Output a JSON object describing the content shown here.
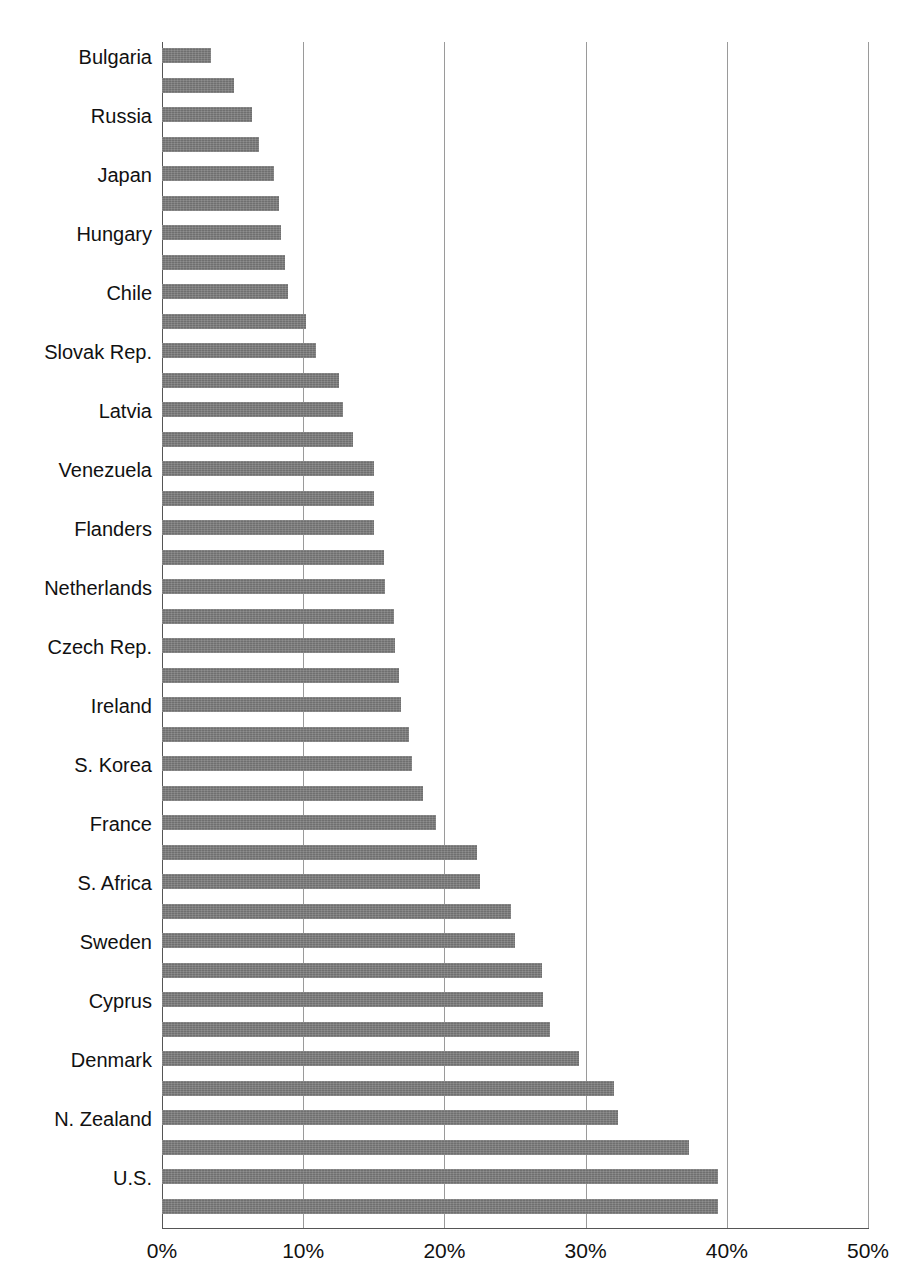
{
  "chart_data": {
    "type": "bar",
    "orientation": "horizontal",
    "title": "",
    "xlabel": "",
    "ylabel": "",
    "xlim": [
      0,
      50
    ],
    "grid": true,
    "legend": false,
    "value_suffix": "%",
    "x_tick_labels": [
      "0%",
      "10%",
      "20%",
      "30%",
      "40%",
      "50%"
    ],
    "x_ticks": [
      0,
      10,
      20,
      30,
      40,
      50
    ],
    "bar_color": "#6f6f6f",
    "gridline_color": "#9a9a9a",
    "axis_color": "#555555",
    "categories": [
      "Bulgaria",
      "",
      "Russia",
      "",
      "Japan",
      "",
      "Hungary",
      "",
      "Chile",
      "",
      "Slovak Rep.",
      "",
      "Latvia",
      "",
      "Venezuela",
      "",
      "Flanders",
      "",
      "Netherlands",
      "",
      "Czech Rep.",
      "",
      "Ireland",
      "",
      "S. Korea",
      "",
      "France",
      "",
      "S. Africa",
      "",
      "Sweden",
      "",
      "Cyprus",
      "",
      "Denmark",
      "",
      "N. Zealand",
      "",
      "U.S.",
      ""
    ],
    "visible_category_labels": [
      "Bulgaria",
      "Russia",
      "Japan",
      "Hungary",
      "Chile",
      "Slovak Rep.",
      "Latvia",
      "Venezuela",
      "Flanders",
      "Netherlands",
      "Czech Rep.",
      "Ireland",
      "S. Korea",
      "France",
      "S. Africa",
      "Sweden",
      "Cyprus",
      "Denmark",
      "N. Zealand",
      "U.S."
    ],
    "values": [
      3.5,
      5.1,
      6.4,
      6.9,
      7.9,
      8.3,
      8.4,
      8.7,
      8.9,
      10.2,
      10.9,
      12.5,
      13.0,
      13.5,
      15.0,
      15.0,
      15.0,
      15.7,
      15.8,
      16.4,
      16.5,
      16.8,
      16.9,
      17.5,
      17.7,
      18.5,
      19.4,
      22.3,
      22.5,
      24.7,
      25.0,
      26.9,
      27.0,
      27.5,
      29.5,
      32.0,
      32.3,
      37.3,
      39.4,
      39.4
    ],
    "bars": [
      {
        "label": "Bulgaria",
        "value": 3.5,
        "labeled": true
      },
      {
        "label": "",
        "value": 5.1,
        "labeled": false
      },
      {
        "label": "Russia",
        "value": 6.4,
        "labeled": true
      },
      {
        "label": "",
        "value": 6.9,
        "labeled": false
      },
      {
        "label": "Japan",
        "value": 7.9,
        "labeled": true
      },
      {
        "label": "",
        "value": 8.3,
        "labeled": false
      },
      {
        "label": "Hungary",
        "value": 8.4,
        "labeled": true
      },
      {
        "label": "",
        "value": 8.7,
        "labeled": false
      },
      {
        "label": "Chile",
        "value": 8.9,
        "labeled": true
      },
      {
        "label": "",
        "value": 10.2,
        "labeled": false
      },
      {
        "label": "Slovak Rep.",
        "value": 10.9,
        "labeled": true
      },
      {
        "label": "",
        "value": 12.5,
        "labeled": false
      },
      {
        "label": "Latvia",
        "value": 12.8,
        "labeled": true
      },
      {
        "label": "",
        "value": 13.5,
        "labeled": false
      },
      {
        "label": "Venezuela",
        "value": 15.0,
        "labeled": true
      },
      {
        "label": "",
        "value": 15.0,
        "labeled": false
      },
      {
        "label": "Flanders",
        "value": 15.0,
        "labeled": true
      },
      {
        "label": "",
        "value": 15.7,
        "labeled": false
      },
      {
        "label": "Netherlands",
        "value": 15.8,
        "labeled": true
      },
      {
        "label": "",
        "value": 16.4,
        "labeled": false
      },
      {
        "label": "Czech Rep.",
        "value": 16.5,
        "labeled": true
      },
      {
        "label": "",
        "value": 16.8,
        "labeled": false
      },
      {
        "label": "Ireland",
        "value": 16.9,
        "labeled": true
      },
      {
        "label": "",
        "value": 17.5,
        "labeled": false
      },
      {
        "label": "S. Korea",
        "value": 17.7,
        "labeled": true
      },
      {
        "label": "",
        "value": 18.5,
        "labeled": false
      },
      {
        "label": "France",
        "value": 19.4,
        "labeled": true
      },
      {
        "label": "",
        "value": 22.3,
        "labeled": false
      },
      {
        "label": "S. Africa",
        "value": 22.5,
        "labeled": true
      },
      {
        "label": "",
        "value": 24.7,
        "labeled": false
      },
      {
        "label": "Sweden",
        "value": 25.0,
        "labeled": true
      },
      {
        "label": "",
        "value": 26.9,
        "labeled": false
      },
      {
        "label": "Cyprus",
        "value": 27.0,
        "labeled": true
      },
      {
        "label": "",
        "value": 27.5,
        "labeled": false
      },
      {
        "label": "Denmark",
        "value": 29.5,
        "labeled": true
      },
      {
        "label": "",
        "value": 32.0,
        "labeled": false
      },
      {
        "label": "N. Zealand",
        "value": 32.3,
        "labeled": true
      },
      {
        "label": "",
        "value": 37.3,
        "labeled": false
      },
      {
        "label": "U.S.",
        "value": 39.4,
        "labeled": true
      },
      {
        "label": "",
        "value": 39.4,
        "labeled": false
      }
    ]
  }
}
